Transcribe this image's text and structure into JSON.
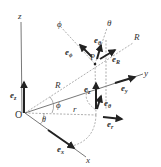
{
  "diagram": {
    "origin_label": "O",
    "point_label": "P",
    "axes": {
      "x": "x",
      "y": "y",
      "z": "z"
    },
    "coordinate_lines": {
      "R": "R",
      "theta": "θ",
      "phi": "ϕ"
    },
    "distances": {
      "R": "R",
      "r": "r"
    },
    "angles": {
      "phi": "ϕ",
      "theta": "θ"
    },
    "unit_vectors": {
      "ex": "e",
      "ex_sub": "x",
      "ey": "e",
      "ey_sub": "y",
      "ez_origin": "e",
      "ez_origin_sub": "z",
      "ez_point": "e",
      "ez_point_sub": "z",
      "er": "e",
      "er_sub": "r",
      "etheta_cyl": "e",
      "etheta_cyl_sub": "θ",
      "eR": "e",
      "eR_sub": "R",
      "etheta_sph": "e",
      "etheta_sph_sub": "θ",
      "ephi": "e",
      "ephi_sub": "ϕ"
    }
  }
}
